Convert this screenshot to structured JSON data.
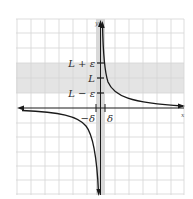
{
  "diagram": {
    "axes": {
      "x_label": "x",
      "y_label": "y"
    },
    "y_labels": {
      "upper": "L + ε",
      "middle": "L",
      "lower": "L − ε"
    },
    "x_labels": {
      "left": "−δ",
      "right": "δ"
    },
    "colors": {
      "grid": "#d4d4d4",
      "band": "#e4e4e4",
      "strip": "#d6d6d6",
      "curve": "#1a1a1a",
      "axis": "#1a1a1a"
    }
  }
}
